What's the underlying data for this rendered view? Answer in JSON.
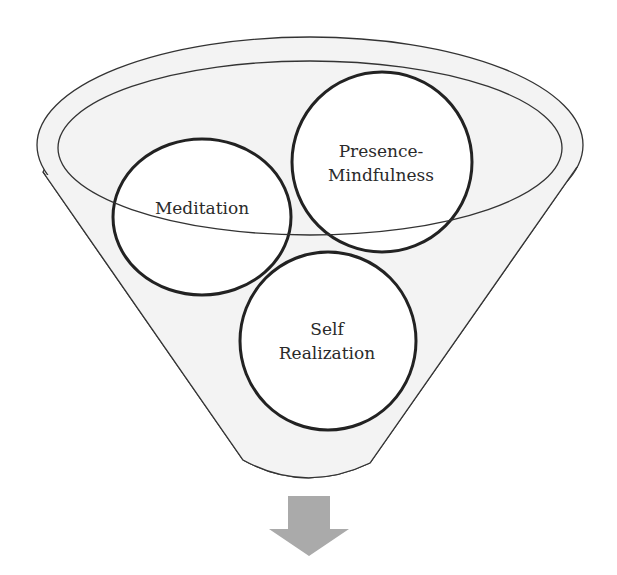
{
  "diagram": {
    "type": "funnel",
    "colors": {
      "funnel_fill": "#f3f3f3",
      "circle_fill": "#ffffff",
      "outline": "#333333",
      "circle_stroke": "#222222",
      "arrow": "#aaaaaa"
    },
    "circles": [
      {
        "id": "meditation",
        "lines": [
          "Meditation"
        ]
      },
      {
        "id": "presence-mindfulness",
        "lines": [
          "Presence-",
          "Mindfulness"
        ]
      },
      {
        "id": "self-realization",
        "lines": [
          "Self",
          "Realization"
        ]
      }
    ],
    "output_arrow": {
      "direction": "down"
    }
  }
}
